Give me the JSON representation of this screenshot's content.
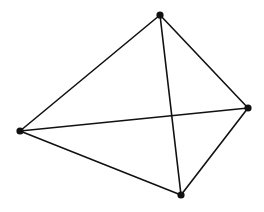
{
  "diagram": {
    "type": "complete-graph-K4",
    "width": 264,
    "height": 212,
    "background": "#ffffff",
    "stroke_color": "#111111",
    "stroke_width": 1.6,
    "node_color": "#111111",
    "node_radius": 3.6,
    "nodes": [
      {
        "id": "top",
        "x": 160,
        "y": 15
      },
      {
        "id": "right",
        "x": 248,
        "y": 108
      },
      {
        "id": "bottom",
        "x": 181,
        "y": 195
      },
      {
        "id": "left",
        "x": 20,
        "y": 131
      }
    ],
    "edges": [
      {
        "from": "top",
        "to": "right"
      },
      {
        "from": "top",
        "to": "left"
      },
      {
        "from": "top",
        "to": "bottom"
      },
      {
        "from": "left",
        "to": "right"
      },
      {
        "from": "left",
        "to": "bottom"
      },
      {
        "from": "right",
        "to": "bottom"
      }
    ]
  }
}
